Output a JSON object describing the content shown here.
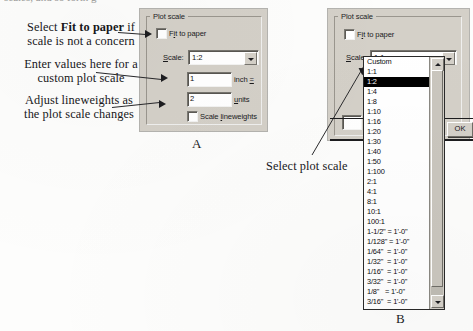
{
  "figure": {
    "top_cut_text": "scales, and so forth g",
    "plate_a_label": "A",
    "plate_b_label": "B"
  },
  "annotations": {
    "a1_part1": "Select ",
    "a1_bold": "Fit to paper",
    "a1_part2": " if",
    "a1_line2": "scale is not a concern",
    "a2_line1": "Enter values here for a",
    "a2_line2": "custom plot scale",
    "a3_line1": "Adjust lineweights as",
    "a3_line2": "the plot scale changes",
    "b1": "Select plot scale"
  },
  "panel_a": {
    "group_title": "Plot scale",
    "fit_to_paper_label": "Fit to paper",
    "fit_to_paper_checked": false,
    "scale_label": "Scale:",
    "scale_value": "1:2",
    "inch_value": "1",
    "inch_label": "inch =",
    "units_value": "2",
    "units_label": "units",
    "scale_lineweights_label": "Scale lineweights",
    "scale_lineweights_checked": false
  },
  "panel_b": {
    "group_title": "Plot scale",
    "fit_to_paper_label": "Fit to paper",
    "fit_to_paper_checked": false,
    "scale_label": "Scale:",
    "scale_value": "1:1",
    "ok_label": "OK",
    "selected_option": "1:2",
    "options": [
      "Custom",
      "1:1",
      "1:2",
      "1:4",
      "1:8",
      "1:10",
      "1:16",
      "1:20",
      "1:30",
      "1:40",
      "1:50",
      "1:100",
      "2:1",
      "4:1",
      "8:1",
      "10:1",
      "100:1",
      "1-1/2\" = 1'-0\"",
      "1/128\" = 1'-0\"",
      "1/64\"  = 1'-0\"",
      "1/32\"  = 1'-0\"",
      "1/16\"  = 1'-0\"",
      "3/32\"  = 1'-0\"",
      "1/8\"   = 1'-0\"",
      "3/16\"  = 1'-0\"",
      "1/4\"   = 1'-0\"",
      "3/8\"   = 1'-0\"",
      "1/2\"   = 1'-0\"",
      "3/4\"   = 1'-0\"",
      "1\"     = 1'-0\""
    ]
  },
  "colors": {
    "dialog_face": "#d4d0c8",
    "field_white": "#ffffff",
    "selection": "#000000",
    "ink": "#17171a"
  }
}
